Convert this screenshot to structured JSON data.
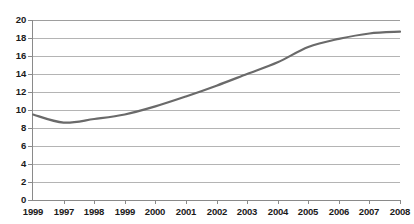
{
  "chart_data": {
    "type": "line",
    "title": "",
    "subtitle": "",
    "xlabel": "",
    "ylabel": "",
    "categories": [
      "1999",
      "1997",
      "1998",
      "1999",
      "2000",
      "2001",
      "2002",
      "2003",
      "2004",
      "2005",
      "2006",
      "2007",
      "2008"
    ],
    "values": [
      9.5,
      8.6,
      9.0,
      9.5,
      10.4,
      11.5,
      12.7,
      14.0,
      15.3,
      17.0,
      17.9,
      18.5,
      18.7
    ],
    "series": [
      {
        "name": "series-1",
        "values": [
          9.5,
          8.6,
          9.0,
          9.5,
          10.4,
          11.5,
          12.7,
          14.0,
          15.3,
          17.0,
          17.9,
          18.5,
          18.7
        ],
        "color": "#6a6a6a"
      }
    ],
    "ylim": [
      0,
      20
    ],
    "ytick_values": [
      20,
      18,
      16,
      14,
      12,
      10,
      8,
      6,
      4,
      2,
      0
    ],
    "ytick_labels": [
      "20",
      "18",
      "16",
      "14",
      "12",
      "10",
      "8",
      "6",
      "4",
      "2",
      "0"
    ],
    "xtick_labels": [
      "1999",
      "1997",
      "1998",
      "1999",
      "2000",
      "2001",
      "2002",
      "2003",
      "2004",
      "2005",
      "2006",
      "2007",
      "2008"
    ],
    "grid": "horizontal",
    "legend": "none",
    "annotations": []
  },
  "style": {
    "line_color": "#6a6a6a",
    "grid_color": "#b4b4b4",
    "axis_color": "#8a8a8a",
    "label_color": "#1a1a1a",
    "background": "#ffffff",
    "watermark_color": "#f3e4de"
  },
  "watermark": {
    "line_1": "",
    "line_2": ""
  }
}
